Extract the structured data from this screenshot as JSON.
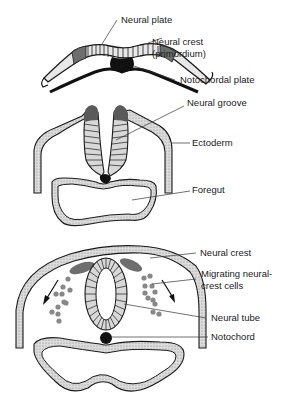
{
  "diagram": {
    "stages": [
      {
        "id": "stage-1",
        "labels": [
          {
            "id": "neural-plate",
            "text": "Neural plate"
          },
          {
            "id": "neural-crest-primordium",
            "line1": "Neural crest",
            "line2": "(primordium)"
          },
          {
            "id": "notochordal-plate",
            "text": "Notochordal plate"
          }
        ]
      },
      {
        "id": "stage-2",
        "labels": [
          {
            "id": "neural-groove",
            "text": "Neural groove"
          },
          {
            "id": "ectoderm",
            "text": "Ectoderm"
          },
          {
            "id": "foregut",
            "text": "Foregut"
          }
        ]
      },
      {
        "id": "stage-3",
        "labels": [
          {
            "id": "neural-crest",
            "text": "Neural crest"
          },
          {
            "id": "migrating-cells",
            "line1": "Migrating neural-",
            "line2": "crest cells"
          },
          {
            "id": "neural-tube",
            "text": "Neural tube"
          },
          {
            "id": "notochord",
            "text": "Notochord"
          }
        ]
      }
    ],
    "colors": {
      "outline": "#1a1a1a",
      "stipple": "#c8c8c8",
      "crest": "#707070",
      "cells": "#888888",
      "black": "#111111"
    }
  }
}
